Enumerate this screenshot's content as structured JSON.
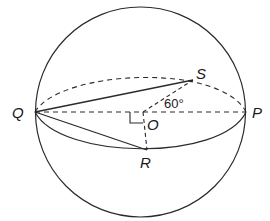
{
  "diagram": {
    "type": "sphere-geometry",
    "colors": {
      "stroke": "#2a2a2a",
      "background": "#ffffff"
    },
    "points": {
      "Q": {
        "label": "Q"
      },
      "P": {
        "label": "P"
      },
      "S": {
        "label": "S"
      },
      "O": {
        "label": "O"
      },
      "R": {
        "label": "R"
      }
    },
    "angle_label": "60°",
    "right_angle_marker": "right-angle at O"
  }
}
